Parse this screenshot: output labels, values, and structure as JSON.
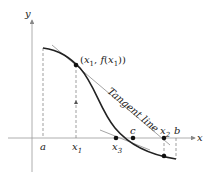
{
  "diagram": {
    "type": "newtons-method-figure",
    "axes": {
      "x_label": "x",
      "y_label": "y"
    },
    "point_label": "(x1, f(x1))",
    "tangent_label": "Tangent line",
    "x_ticks": [
      "a",
      "x1",
      "x3",
      "c",
      "x2",
      "b"
    ],
    "colors": {
      "curve": "#222222",
      "tangent": "#9a9a9a",
      "axes": "#888888"
    }
  }
}
